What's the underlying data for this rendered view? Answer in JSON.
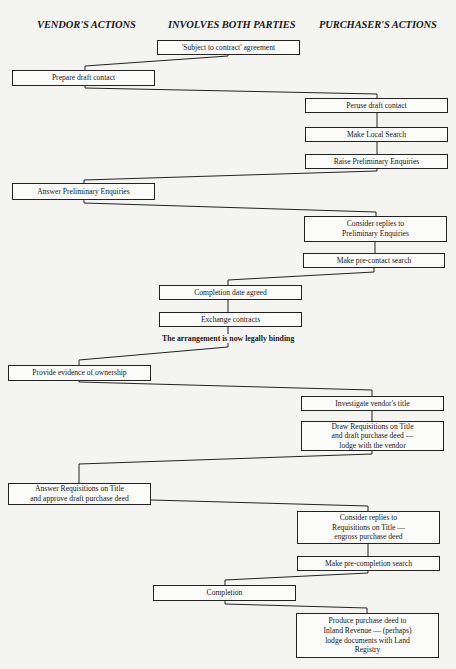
{
  "headers": {
    "vendor": "VENDOR'S ACTIONS",
    "both": "INVOLVES BOTH PARTIES",
    "purchaser": "PURCHASER'S ACTIONS"
  },
  "steps": [
    {
      "id": "s1",
      "column": "both",
      "text": "'Subject to contract' agreement"
    },
    {
      "id": "s2",
      "column": "vendor",
      "text": "Prepare draft contact"
    },
    {
      "id": "s3",
      "column": "purchaser",
      "text": "Peruse draft contact"
    },
    {
      "id": "s4",
      "column": "purchaser",
      "text": "Make Local Search"
    },
    {
      "id": "s5",
      "column": "purchaser",
      "text": "Raise Preliminary Enquiries"
    },
    {
      "id": "s6",
      "column": "vendor",
      "text": "Answer Preliminary Enquiries"
    },
    {
      "id": "s7",
      "column": "purchaser",
      "text": "Consider replies to\nPreliminary Enquiries"
    },
    {
      "id": "s8",
      "column": "purchaser",
      "text": "Make pre-contact search"
    },
    {
      "id": "s9",
      "column": "both",
      "text": "Completion date agreed"
    },
    {
      "id": "s10",
      "column": "both",
      "text": "Exchange contracts"
    },
    {
      "id": "s11",
      "column": "vendor",
      "text": "Provide evidence of ownership"
    },
    {
      "id": "s12",
      "column": "purchaser",
      "text": "Investigate vendor's title"
    },
    {
      "id": "s13",
      "column": "purchaser",
      "text": "Draw Requisitions on Title\nand draft purchase deed —\nlodge with the vendor"
    },
    {
      "id": "s14",
      "column": "vendor",
      "text": "Answer Requisitions on Title\nand approve draft purchase deed"
    },
    {
      "id": "s15",
      "column": "purchaser",
      "text": "Consider replies to\nRequisitions on Title —\nengross purchase deed"
    },
    {
      "id": "s16",
      "column": "purchaser",
      "text": "Make pre-completion search"
    },
    {
      "id": "s17",
      "column": "both",
      "text": "Completion"
    },
    {
      "id": "s18",
      "column": "purchaser",
      "text": "Produce purchase deed to\nInland Revenue — (perhaps)\nlodge documents with Land\nRegistry"
    }
  ],
  "notes": {
    "binding": "The arrangement is now legally binding"
  }
}
